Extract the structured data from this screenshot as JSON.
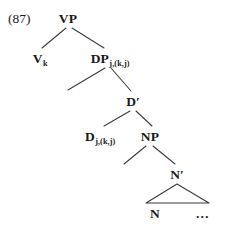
{
  "figure": {
    "example_number": "(87)",
    "background_color": "#ffffff",
    "line_color": "#3a3a3a",
    "text_color": "#1a1a1a"
  },
  "tree": {
    "nodes": [
      {
        "id": "vp",
        "label": "VP",
        "subscript": "",
        "prime": false,
        "x": 68,
        "y": 12
      },
      {
        "id": "v",
        "label": "V",
        "subscript": "k",
        "prime": false,
        "x": 40,
        "y": 52
      },
      {
        "id": "dp",
        "label": "DP",
        "subscript": "j,(k,j)",
        "prime": false,
        "x": 110,
        "y": 52
      },
      {
        "id": "dbar",
        "label": "D",
        "subscript": "",
        "prime": true,
        "x": 133,
        "y": 95
      },
      {
        "id": "d",
        "label": "D",
        "subscript": "j,(k,j)",
        "prime": false,
        "x": 100,
        "y": 130
      },
      {
        "id": "np",
        "label": "NP",
        "subscript": "",
        "prime": false,
        "x": 150,
        "y": 130
      },
      {
        "id": "nbar",
        "label": "N",
        "subscript": "",
        "prime": true,
        "x": 177,
        "y": 168
      },
      {
        "id": "n",
        "label": "N",
        "subscript": "",
        "prime": false,
        "x": 155,
        "y": 207
      }
    ],
    "ellipsis": {
      "id": "ellipsis",
      "label": "…",
      "x": 203,
      "y": 207
    },
    "branches": [
      {
        "from": "vp",
        "to": "v",
        "x1": 66,
        "y1": 28,
        "x2": 42,
        "y2": 48
      },
      {
        "from": "vp",
        "to": "dp",
        "x1": 72,
        "y1": 28,
        "x2": 104,
        "y2": 48
      },
      {
        "from": "dp",
        "to": "spec",
        "x1": 105,
        "y1": 68,
        "x2": 68,
        "y2": 90
      },
      {
        "from": "dp",
        "to": "dbar",
        "x1": 111,
        "y1": 68,
        "x2": 131,
        "y2": 91
      },
      {
        "from": "dbar",
        "to": "d",
        "x1": 130,
        "y1": 111,
        "x2": 104,
        "y2": 126
      },
      {
        "from": "dbar",
        "to": "np",
        "x1": 136,
        "y1": 111,
        "x2": 152,
        "y2": 126
      },
      {
        "from": "np",
        "to": "spec",
        "x1": 146,
        "y1": 146,
        "x2": 124,
        "y2": 164
      },
      {
        "from": "np",
        "to": "nbar",
        "x1": 153,
        "y1": 146,
        "x2": 175,
        "y2": 164
      }
    ],
    "triangle": {
      "apex_x": 177,
      "apex_y": 184,
      "left_x": 146,
      "right_x": 209,
      "base_y": 203
    }
  }
}
